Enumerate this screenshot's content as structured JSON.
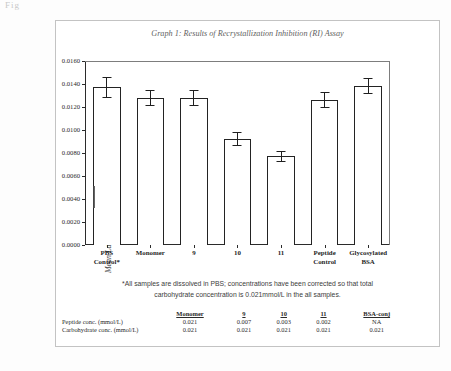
{
  "artifact_text": "Fig",
  "figure": {
    "title": "Graph 1: Results of Recrystallization Inhibition (RI) Assay",
    "footnote_line1": "*All samples are dissolved in PBS; concentrations have been corrected so that total",
    "footnote_line2": "carbohydrate concentration is 0.021mmol/L in the all samples."
  },
  "chart_data": {
    "type": "bar",
    "title": "Graph 1: Results of Recrystallization Inhibition (RI) Assay",
    "xlabel": "",
    "ylabel": "Mean Largest Grain Size (MLGMS) mm²",
    "ylim": [
      0.0,
      0.016
    ],
    "ytick_labels": [
      "0.0160",
      "0.0140",
      "0.0120",
      "0.0100",
      "0.0080",
      "0.0060",
      "0.0040",
      "0.0020",
      "0.0000"
    ],
    "ytick_values": [
      0.016,
      0.014,
      0.012,
      0.01,
      0.008,
      0.006,
      0.004,
      0.002,
      0.0
    ],
    "grid": false,
    "legend": "none",
    "categories": [
      "PBS Control*",
      "Monomer",
      "9",
      "10",
      "11",
      "Peptide Control",
      "Glycosylated BSA"
    ],
    "category_lines": [
      [
        "PBS",
        "Control*"
      ],
      [
        "Monomer",
        ""
      ],
      [
        "9",
        ""
      ],
      [
        "10",
        ""
      ],
      [
        "11",
        ""
      ],
      [
        "Peptide",
        "Control"
      ],
      [
        "Glycosylated",
        "BSA"
      ]
    ],
    "values": [
      0.0137,
      0.0128,
      0.0128,
      0.0092,
      0.0077,
      0.0126,
      0.0138
    ],
    "errors": [
      0.0009,
      0.0007,
      0.0007,
      0.0006,
      0.0005,
      0.0007,
      0.0007
    ]
  },
  "table": {
    "row_header_label": "",
    "columns": [
      "Monomer",
      "9",
      "10",
      "11",
      "BSA-conj"
    ],
    "rows": [
      {
        "label": "Peptide conc. (mmol/L)",
        "values": [
          "0.021",
          "0.007",
          "0.003",
          "0.002",
          "NA"
        ]
      },
      {
        "label": "Carbohydrate conc. (mmol/L)",
        "values": [
          "0.021",
          "0.021",
          "0.021",
          "0.021",
          "0.021"
        ]
      }
    ]
  },
  "colors": {
    "bar_outline": "#232323",
    "bar_fill": "#ffffff",
    "axis": "#2b2b2b",
    "box_border": "#c3c3c3",
    "title_text": "#5f5f5f"
  }
}
